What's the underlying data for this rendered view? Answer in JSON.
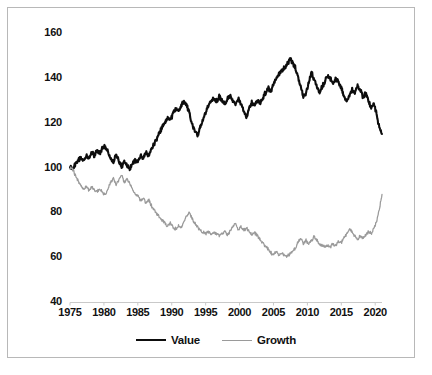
{
  "chart_data": {
    "type": "line",
    "title": "",
    "subtitle": "",
    "xlabel": "",
    "ylabel": "",
    "xlim": [
      1975,
      2021
    ],
    "ylim": [
      40,
      160
    ],
    "grid": false,
    "legend_position": "bottom-center",
    "x_tick_labels": [
      "1975",
      "1980",
      "1985",
      "1990",
      "1995",
      "2000",
      "2005",
      "2010",
      "2015",
      "2020"
    ],
    "x_ticks": [
      1975,
      1980,
      1985,
      1990,
      1995,
      2000,
      2005,
      2010,
      2015,
      2020
    ],
    "y_tick_labels": [
      "160",
      "140",
      "120",
      "100",
      "80",
      "60",
      "40"
    ],
    "y_ticks": [
      160,
      140,
      120,
      100,
      80,
      60,
      40
    ],
    "colors": {
      "value": "#0d0d0d",
      "growth": "#9a9a9a",
      "frame": "#b8b8b8",
      "background": "#ffffff",
      "axis": "#c9c9c9",
      "text": "#111111"
    },
    "series": [
      {
        "name": "Value",
        "color": "#0d0d0d",
        "x": [
          1975.0,
          1975.4,
          1975.8,
          1976.2,
          1976.6,
          1977.0,
          1977.4,
          1977.8,
          1978.2,
          1978.6,
          1979.0,
          1979.4,
          1979.8,
          1980.2,
          1980.6,
          1981.0,
          1981.4,
          1981.8,
          1982.2,
          1982.6,
          1983.0,
          1983.4,
          1983.8,
          1984.2,
          1984.6,
          1985.0,
          1985.4,
          1985.8,
          1986.2,
          1986.6,
          1987.0,
          1987.4,
          1987.8,
          1988.2,
          1988.6,
          1989.0,
          1989.4,
          1989.8,
          1990.2,
          1990.6,
          1991.0,
          1991.4,
          1991.8,
          1992.2,
          1992.6,
          1993.0,
          1993.4,
          1993.8,
          1994.2,
          1994.6,
          1995.0,
          1995.4,
          1995.8,
          1996.2,
          1996.6,
          1997.0,
          1997.4,
          1997.8,
          1998.2,
          1998.6,
          1999.0,
          1999.4,
          1999.8,
          2000.2,
          2000.6,
          2001.0,
          2001.4,
          2001.8,
          2002.2,
          2002.6,
          2003.0,
          2003.4,
          2003.8,
          2004.2,
          2004.6,
          2005.0,
          2005.4,
          2005.8,
          2006.2,
          2006.6,
          2007.0,
          2007.4,
          2007.8,
          2008.2,
          2008.6,
          2009.0,
          2009.4,
          2009.8,
          2010.2,
          2010.6,
          2011.0,
          2011.4,
          2011.8,
          2012.2,
          2012.6,
          2013.0,
          2013.4,
          2013.8,
          2014.2,
          2014.6,
          2015.0,
          2015.4,
          2015.8,
          2016.2,
          2016.6,
          2017.0,
          2017.4,
          2017.8,
          2018.2,
          2018.6,
          2019.0,
          2019.4,
          2019.8,
          2020.2,
          2020.6,
          2021.0
        ],
        "values": [
          100.0,
          99.5,
          101.5,
          103.5,
          104.5,
          103.0,
          105.5,
          104.0,
          106.5,
          105.5,
          107.5,
          106.0,
          108.5,
          109.5,
          107.0,
          104.0,
          102.5,
          105.5,
          103.0,
          100.5,
          103.0,
          101.0,
          99.5,
          101.5,
          103.5,
          102.5,
          105.0,
          104.0,
          106.5,
          105.5,
          108.0,
          110.5,
          113.0,
          115.5,
          118.0,
          120.5,
          122.5,
          121.0,
          124.0,
          126.5,
          125.0,
          127.5,
          129.5,
          128.0,
          124.0,
          119.5,
          116.0,
          114.5,
          118.0,
          121.5,
          124.5,
          127.0,
          129.5,
          131.0,
          129.5,
          131.5,
          130.0,
          128.5,
          130.5,
          132.0,
          130.0,
          128.0,
          130.5,
          129.0,
          125.0,
          122.5,
          126.0,
          129.0,
          127.5,
          130.0,
          128.5,
          131.0,
          133.0,
          135.5,
          134.0,
          137.0,
          139.5,
          141.5,
          143.0,
          144.5,
          146.0,
          148.5,
          147.0,
          144.5,
          141.0,
          136.0,
          131.5,
          133.5,
          138.0,
          142.5,
          139.0,
          136.0,
          133.5,
          136.0,
          138.5,
          141.0,
          139.5,
          137.5,
          139.5,
          138.0,
          135.5,
          132.0,
          129.0,
          132.0,
          135.0,
          133.0,
          136.5,
          134.5,
          131.5,
          133.0,
          129.5,
          127.0,
          128.5,
          124.0,
          118.0,
          115.0
        ]
      },
      {
        "name": "Growth",
        "color": "#9a9a9a",
        "x": [
          1975.0,
          1975.4,
          1975.8,
          1976.2,
          1976.6,
          1977.0,
          1977.4,
          1977.8,
          1978.2,
          1978.6,
          1979.0,
          1979.4,
          1979.8,
          1980.2,
          1980.6,
          1981.0,
          1981.4,
          1981.8,
          1982.2,
          1982.6,
          1983.0,
          1983.4,
          1983.8,
          1984.2,
          1984.6,
          1985.0,
          1985.4,
          1985.8,
          1986.2,
          1986.6,
          1987.0,
          1987.4,
          1987.8,
          1988.2,
          1988.6,
          1989.0,
          1989.4,
          1989.8,
          1990.2,
          1990.6,
          1991.0,
          1991.4,
          1991.8,
          1992.2,
          1992.6,
          1993.0,
          1993.4,
          1993.8,
          1994.2,
          1994.6,
          1995.0,
          1995.4,
          1995.8,
          1996.2,
          1996.6,
          1997.0,
          1997.4,
          1997.8,
          1998.2,
          1998.6,
          1999.0,
          1999.4,
          1999.8,
          2000.2,
          2000.6,
          2001.0,
          2001.4,
          2001.8,
          2002.2,
          2002.6,
          2003.0,
          2003.4,
          2003.8,
          2004.2,
          2004.6,
          2005.0,
          2005.4,
          2005.8,
          2006.2,
          2006.6,
          2007.0,
          2007.4,
          2007.8,
          2008.2,
          2008.6,
          2009.0,
          2009.4,
          2009.8,
          2010.2,
          2010.6,
          2011.0,
          2011.4,
          2011.8,
          2012.2,
          2012.6,
          2013.0,
          2013.4,
          2013.8,
          2014.2,
          2014.6,
          2015.0,
          2015.4,
          2015.8,
          2016.2,
          2016.6,
          2017.0,
          2017.4,
          2017.8,
          2018.2,
          2018.6,
          2019.0,
          2019.4,
          2019.8,
          2020.2,
          2020.6,
          2021.0
        ],
        "values": [
          100.0,
          99.0,
          96.5,
          94.0,
          92.0,
          90.5,
          91.5,
          90.0,
          91.0,
          90.0,
          89.5,
          90.5,
          89.0,
          88.0,
          90.5,
          93.5,
          95.5,
          92.0,
          94.5,
          96.5,
          93.5,
          95.0,
          93.0,
          90.5,
          88.0,
          87.5,
          85.5,
          86.5,
          84.0,
          85.5,
          83.0,
          81.0,
          79.5,
          78.0,
          76.5,
          75.0,
          74.0,
          75.0,
          73.5,
          72.5,
          74.0,
          73.0,
          75.5,
          78.5,
          80.0,
          77.5,
          75.0,
          73.5,
          72.0,
          71.0,
          70.5,
          71.5,
          70.0,
          71.0,
          70.5,
          69.5,
          70.5,
          71.5,
          70.0,
          71.5,
          73.5,
          75.0,
          72.5,
          73.5,
          72.0,
          73.0,
          71.5,
          70.0,
          71.0,
          69.5,
          68.0,
          66.5,
          65.0,
          63.5,
          62.0,
          61.5,
          62.5,
          61.0,
          62.0,
          61.0,
          60.5,
          61.5,
          62.5,
          64.0,
          66.5,
          68.5,
          66.0,
          67.5,
          66.0,
          67.5,
          69.0,
          67.5,
          66.0,
          65.0,
          64.5,
          65.5,
          64.5,
          66.0,
          65.0,
          67.0,
          66.5,
          68.5,
          70.5,
          72.5,
          71.0,
          69.5,
          68.0,
          69.5,
          68.5,
          70.0,
          71.5,
          70.5,
          73.0,
          76.0,
          81.0,
          88.0
        ]
      }
    ]
  },
  "axes": {
    "y_tick_labels": [
      "160",
      "140",
      "120",
      "100",
      "80",
      "60",
      "40"
    ],
    "x_tick_labels": [
      "1975",
      "1980",
      "1985",
      "1990",
      "1995",
      "2000",
      "2005",
      "2010",
      "2015",
      "2020"
    ]
  },
  "legend": {
    "entries": [
      {
        "label": "Value",
        "color": "#0d0d0d"
      },
      {
        "label": "Growth",
        "color": "#9a9a9a"
      }
    ]
  }
}
